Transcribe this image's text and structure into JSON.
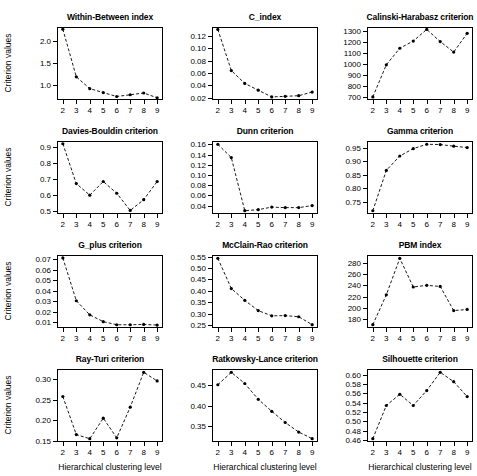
{
  "figure": {
    "xlabel": "Hierarchical clustering level",
    "ylabel": "Criterion values",
    "x_categories": [
      2,
      3,
      4,
      5,
      6,
      7,
      8,
      9
    ],
    "line_color": "#000000",
    "point_color": "#000000",
    "background": "#ffffff"
  },
  "chart_data": [
    {
      "type": "line",
      "title": "Within-Between index",
      "xlabel": "Hierarchical clustering level",
      "ylabel": "Criterion values",
      "x": [
        2,
        3,
        4,
        5,
        6,
        7,
        8,
        9
      ],
      "values": [
        2.28,
        1.19,
        0.92,
        0.83,
        0.74,
        0.78,
        0.82,
        0.71
      ],
      "yticks": [
        1.0,
        1.5,
        2.0
      ],
      "ytick_labels": [
        "1.0",
        "1.5",
        "2.0"
      ],
      "ylim": [
        0.66,
        2.33
      ],
      "grid": false,
      "legend": "none"
    },
    {
      "type": "line",
      "title": "C_index",
      "xlabel": "Hierarchical clustering level",
      "ylabel": "Criterion values",
      "x": [
        2,
        3,
        4,
        5,
        6,
        7,
        8,
        9
      ],
      "values": [
        0.131,
        0.064,
        0.043,
        0.032,
        0.021,
        0.022,
        0.023,
        0.029
      ],
      "yticks": [
        0.02,
        0.04,
        0.06,
        0.08,
        0.1,
        0.12
      ],
      "ytick_labels": [
        "0.02",
        "0.04",
        "0.06",
        "0.08",
        "0.10",
        "0.12"
      ],
      "ylim": [
        0.016,
        0.135
      ],
      "grid": false,
      "legend": "none"
    },
    {
      "type": "line",
      "title": "Calinski-Harabasz criterion",
      "xlabel": "Hierarchical clustering level",
      "ylabel": "Criterion values",
      "x": [
        2,
        3,
        4,
        5,
        6,
        7,
        8,
        9
      ],
      "values": [
        700,
        990,
        1140,
        1205,
        1310,
        1200,
        1105,
        1275
      ],
      "yticks": [
        700,
        800,
        900,
        1000,
        1100,
        1200,
        1300
      ],
      "ytick_labels": [
        "700",
        "800",
        "900",
        "1000",
        "1100",
        "1200",
        "1300"
      ],
      "ylim": [
        672,
        1332
      ],
      "grid": false,
      "legend": "none"
    },
    {
      "type": "line",
      "title": "Davies-Bouldin criterion",
      "xlabel": "Hierarchical clustering level",
      "ylabel": "Criterion values",
      "x": [
        2,
        3,
        4,
        5,
        6,
        7,
        8,
        9
      ],
      "values": [
        0.92,
        0.672,
        0.6,
        0.685,
        0.612,
        0.505,
        0.572,
        0.685
      ],
      "yticks": [
        0.5,
        0.6,
        0.7,
        0.8,
        0.9
      ],
      "ytick_labels": [
        "0.5",
        "0.6",
        "0.7",
        "0.8",
        "0.9"
      ],
      "ylim": [
        0.483,
        0.937
      ],
      "grid": false,
      "legend": "none"
    },
    {
      "type": "line",
      "title": "Dunn criterion",
      "xlabel": "Hierarchical clustering level",
      "ylabel": "Criterion values",
      "x": [
        2,
        3,
        4,
        5,
        6,
        7,
        8,
        9
      ],
      "values": [
        0.16,
        0.134,
        0.03,
        0.032,
        0.037,
        0.036,
        0.036,
        0.04
      ],
      "yticks": [
        0.04,
        0.06,
        0.08,
        0.1,
        0.12,
        0.14,
        0.16
      ],
      "ytick_labels": [
        "0.04",
        "0.06",
        "0.08",
        "0.10",
        "0.12",
        "0.14",
        "0.16"
      ],
      "ylim": [
        0.0235,
        0.1665
      ],
      "grid": false,
      "legend": "none"
    },
    {
      "type": "line",
      "title": "Gamma criterion",
      "xlabel": "Hierarchical clustering level",
      "ylabel": "Criterion values",
      "x": [
        2,
        3,
        4,
        5,
        6,
        7,
        8,
        9
      ],
      "values": [
        0.718,
        0.866,
        0.919,
        0.946,
        0.962,
        0.961,
        0.955,
        0.95
      ],
      "yticks": [
        0.75,
        0.8,
        0.85,
        0.9,
        0.95
      ],
      "ytick_labels": [
        "0.75",
        "0.80",
        "0.85",
        "0.90",
        "0.95"
      ],
      "ylim": [
        0.706,
        0.974
      ],
      "grid": false,
      "legend": "none"
    },
    {
      "type": "line",
      "title": "G_plus criterion",
      "xlabel": "Hierarchical clustering level",
      "ylabel": "Criterion values",
      "x": [
        2,
        3,
        4,
        5,
        6,
        7,
        8,
        9
      ],
      "values": [
        0.0715,
        0.0305,
        0.017,
        0.0105,
        0.0075,
        0.0075,
        0.0078,
        0.0072
      ],
      "yticks": [
        0.01,
        0.02,
        0.03,
        0.04,
        0.05,
        0.06,
        0.07
      ],
      "ytick_labels": [
        "0.01",
        "0.02",
        "0.03",
        "0.04",
        "0.05",
        "0.06",
        "0.07"
      ],
      "ylim": [
        0.0044,
        0.0743
      ],
      "grid": false,
      "legend": "none"
    },
    {
      "type": "line",
      "title": "McClain-Rao criterion",
      "xlabel": "Hierarchical clustering level",
      "ylabel": "Criterion values",
      "x": [
        2,
        3,
        4,
        5,
        6,
        7,
        8,
        9
      ],
      "values": [
        0.543,
        0.41,
        0.358,
        0.313,
        0.29,
        0.291,
        0.286,
        0.251
      ],
      "yticks": [
        0.25,
        0.3,
        0.35,
        0.4,
        0.45,
        0.5,
        0.55
      ],
      "ytick_labels": [
        "0.25",
        "0.30",
        "0.35",
        "0.40",
        "0.45",
        "0.50",
        "0.55"
      ],
      "ylim": [
        0.2365,
        0.5575
      ],
      "grid": false,
      "legend": "none"
    },
    {
      "type": "line",
      "title": "PBM index",
      "xlabel": "Hierarchical clustering level",
      "ylabel": "Criterion values",
      "x": [
        2,
        3,
        4,
        5,
        6,
        7,
        8,
        9
      ],
      "values": [
        170,
        223,
        288,
        237,
        240,
        238,
        195,
        197
      ],
      "yticks": [
        180,
        200,
        220,
        240,
        260,
        280
      ],
      "ytick_labels": [
        "180",
        "200",
        "220",
        "240",
        "260",
        "280"
      ],
      "ylim": [
        164,
        294
      ],
      "grid": false,
      "legend": "none"
    },
    {
      "type": "line",
      "title": "Ray-Turi criterion",
      "xlabel": "Hierarchical clustering level",
      "ylabel": "Criterion values",
      "x": [
        2,
        3,
        4,
        5,
        6,
        7,
        8,
        9
      ],
      "values": [
        0.258,
        0.165,
        0.155,
        0.205,
        0.157,
        0.232,
        0.317,
        0.296
      ],
      "yticks": [
        0.15,
        0.2,
        0.25,
        0.3
      ],
      "ytick_labels": [
        "0.15",
        "0.20",
        "0.25",
        "0.30"
      ],
      "ylim": [
        0.1469,
        0.3251
      ],
      "grid": false,
      "legend": "none"
    },
    {
      "type": "line",
      "title": "Ratkowsky-Lance criterion",
      "xlabel": "Hierarchical clustering level",
      "ylabel": "Criterion values",
      "x": [
        2,
        3,
        4,
        5,
        6,
        7,
        8,
        9
      ],
      "values": [
        0.45,
        0.48,
        0.453,
        0.415,
        0.386,
        0.359,
        0.336,
        0.32
      ],
      "yticks": [
        0.35,
        0.4,
        0.45
      ],
      "ytick_labels": [
        "0.35",
        "0.40",
        "0.45"
      ],
      "ylim": [
        0.312,
        0.488
      ],
      "grid": false,
      "legend": "none"
    },
    {
      "type": "line",
      "title": "Silhouette criterion",
      "xlabel": "Hierarchical clustering level",
      "ylabel": "Criterion values",
      "x": [
        2,
        3,
        4,
        5,
        6,
        7,
        8,
        9
      ],
      "values": [
        0.463,
        0.534,
        0.558,
        0.534,
        0.566,
        0.605,
        0.585,
        0.553
      ],
      "yticks": [
        0.46,
        0.48,
        0.5,
        0.52,
        0.54,
        0.56,
        0.58,
        0.6
      ],
      "ytick_labels": [
        "0.46",
        "0.48",
        "0.50",
        "0.52",
        "0.54",
        "0.56",
        "0.58",
        "0.60"
      ],
      "ylim": [
        0.4559,
        0.6121
      ],
      "grid": false,
      "legend": "none"
    }
  ]
}
